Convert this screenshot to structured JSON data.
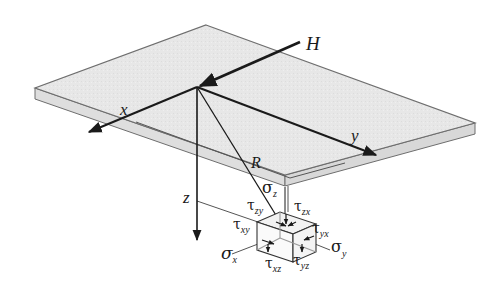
{
  "diagram": {
    "colors": {
      "plane_fill": "#e6e6e6",
      "plane_edge": "#6e6e6e",
      "line": "#1a1a1a",
      "background": "#ffffff"
    },
    "labels": {
      "force": "H",
      "axis_x": "x",
      "axis_y": "y",
      "axis_z": "z",
      "distance": "R"
    },
    "stresses": {
      "sigma_z": {
        "symbol": "σ",
        "sub": "z"
      },
      "sigma_x": {
        "symbol": "σ",
        "sub": "x"
      },
      "sigma_y": {
        "symbol": "σ",
        "sub": "y"
      },
      "tau_zy": {
        "symbol": "τ",
        "sub": "zy"
      },
      "tau_zx": {
        "symbol": "τ",
        "sub": "zx"
      },
      "tau_xy": {
        "symbol": "τ",
        "sub": "xy"
      },
      "tau_yx": {
        "symbol": "τ",
        "sub": "yx"
      },
      "tau_xz": {
        "symbol": "τ",
        "sub": "xz"
      },
      "tau_yz": {
        "symbol": "τ",
        "sub": "yz"
      }
    }
  }
}
